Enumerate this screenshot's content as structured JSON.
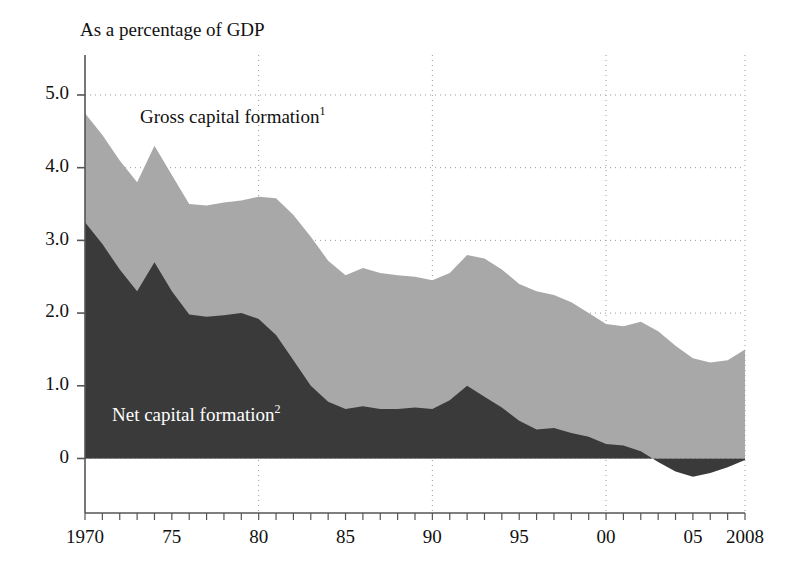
{
  "figure": {
    "unit_title": "As a percentage of GDP",
    "background_color": "#ffffff",
    "axis_color": "#555555",
    "grid_color": "#9a9a9a"
  },
  "chart_data": {
    "type": "area",
    "stacked": false,
    "title": "",
    "subtitle": "",
    "xlabel": "",
    "ylabel": "",
    "unit_note": "As a percentage of GDP",
    "grid": true,
    "gridlines_y": [
      0,
      2.0,
      3.0,
      4.0,
      5.0
    ],
    "gridlines_x": [
      1980,
      1990,
      2000,
      2008
    ],
    "legend_position": "inline-annotations",
    "xlim": [
      1970,
      2008
    ],
    "ylim": [
      -0.75,
      5.55
    ],
    "yticks": [
      0,
      1.0,
      2.0,
      3.0,
      4.0,
      5.0
    ],
    "ytick_labels": [
      "0",
      "1.0",
      "2.0",
      "3.0",
      "4.0",
      "5.0"
    ],
    "xticks": [
      1970,
      1975,
      1980,
      1985,
      1990,
      1995,
      2000,
      2005,
      2008
    ],
    "xtick_labels": [
      "1970",
      "75",
      "80",
      "85",
      "90",
      "95",
      "00",
      "05",
      "2008"
    ],
    "x": [
      1970,
      1971,
      1972,
      1973,
      1974,
      1975,
      1976,
      1977,
      1978,
      1979,
      1980,
      1981,
      1982,
      1983,
      1984,
      1985,
      1986,
      1987,
      1988,
      1989,
      1990,
      1991,
      1992,
      1993,
      1994,
      1995,
      1996,
      1997,
      1998,
      1999,
      2000,
      2001,
      2002,
      2003,
      2004,
      2005,
      2006,
      2007,
      2008
    ],
    "series": [
      {
        "name": "Gross capital formation",
        "footnote": "1",
        "label": "Gross capital formation¹",
        "color": "#a8a8a8",
        "values": [
          4.75,
          4.45,
          4.1,
          3.8,
          4.3,
          3.9,
          3.5,
          3.48,
          3.52,
          3.55,
          3.6,
          3.58,
          3.35,
          3.05,
          2.72,
          2.52,
          2.62,
          2.55,
          2.52,
          2.5,
          2.45,
          2.55,
          2.8,
          2.75,
          2.6,
          2.4,
          2.3,
          2.25,
          2.15,
          2.0,
          1.85,
          1.82,
          1.88,
          1.75,
          1.55,
          1.38,
          1.32,
          1.35,
          1.5
        ]
      },
      {
        "name": "Net capital formation",
        "footnote": "2",
        "label": "Net capital formation²",
        "color": "#3a3a3a",
        "values": [
          3.25,
          2.95,
          2.6,
          2.3,
          2.7,
          2.3,
          1.98,
          1.95,
          1.97,
          2.0,
          1.92,
          1.7,
          1.35,
          1.0,
          0.78,
          0.68,
          0.72,
          0.68,
          0.68,
          0.7,
          0.68,
          0.8,
          1.0,
          0.85,
          0.7,
          0.52,
          0.4,
          0.42,
          0.35,
          0.3,
          0.2,
          0.18,
          0.1,
          -0.05,
          -0.18,
          -0.25,
          -0.2,
          -0.12,
          -0.02
        ]
      }
    ]
  }
}
